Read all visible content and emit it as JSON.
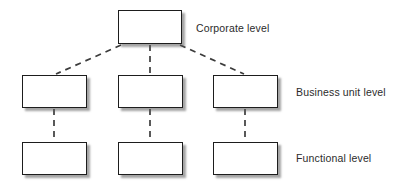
{
  "diagram": {
    "type": "hierarchy-tree",
    "background_color": "#ffffff",
    "box_border_color": "#1d1d1d",
    "shadow_color": "#5a5a5a",
    "connector_color": "#3c3c3c",
    "text_color": "#2b2b2b",
    "levels": [
      {
        "id": "corporate",
        "label": "Corporate level",
        "node_count": 1,
        "nodes": [
          {
            "id": "corporate-node-1",
            "text": "",
            "x": 118,
            "y": 10,
            "width": 64,
            "height": 34
          }
        ],
        "label_x": 196,
        "label_y": 22
      },
      {
        "id": "business-unit",
        "label": "Business unit level",
        "node_count": 3,
        "nodes": [
          {
            "id": "business-node-1",
            "text": "",
            "x": 22,
            "y": 75,
            "width": 65,
            "height": 33
          },
          {
            "id": "business-node-2",
            "text": "",
            "x": 118,
            "y": 75,
            "width": 65,
            "height": 33
          },
          {
            "id": "business-node-3",
            "text": "",
            "x": 213,
            "y": 75,
            "width": 65,
            "height": 33
          }
        ],
        "label_x": 296,
        "label_y": 86
      },
      {
        "id": "functional",
        "label": "Functional level",
        "node_count": 3,
        "nodes": [
          {
            "id": "functional-node-1",
            "text": "",
            "x": 22,
            "y": 142,
            "width": 65,
            "height": 33
          },
          {
            "id": "functional-node-2",
            "text": "",
            "x": 118,
            "y": 142,
            "width": 65,
            "height": 33
          },
          {
            "id": "functional-node-3",
            "text": "",
            "x": 213,
            "y": 142,
            "width": 65,
            "height": 33
          }
        ],
        "label_x": 296,
        "label_y": 152
      }
    ],
    "connectors": [
      {
        "id": "corp-to-bu-left",
        "style": "dashed",
        "from": "corporate-node-1",
        "to": "business-node-1",
        "x1": 121,
        "y1": 45,
        "x2": 56,
        "y2": 74
      },
      {
        "id": "corp-to-bu-middle",
        "style": "dashed",
        "from": "corporate-node-1",
        "to": "business-node-2",
        "x1": 150,
        "y1": 45,
        "x2": 150,
        "y2": 74
      },
      {
        "id": "corp-to-bu-right",
        "style": "dashed",
        "from": "corporate-node-1",
        "to": "business-node-3",
        "x1": 180,
        "y1": 45,
        "x2": 244,
        "y2": 74
      },
      {
        "id": "bu-to-fn-left",
        "style": "dashed",
        "from": "business-node-1",
        "to": "functional-node-1",
        "x1": 54,
        "y1": 109,
        "x2": 54,
        "y2": 141
      },
      {
        "id": "bu-to-fn-middle",
        "style": "dashed",
        "from": "business-node-2",
        "to": "functional-node-2",
        "x1": 150,
        "y1": 109,
        "x2": 150,
        "y2": 141
      },
      {
        "id": "bu-to-fn-right",
        "style": "dashed",
        "from": "business-node-3",
        "to": "functional-node-3",
        "x1": 245,
        "y1": 109,
        "x2": 245,
        "y2": 141
      }
    ]
  }
}
